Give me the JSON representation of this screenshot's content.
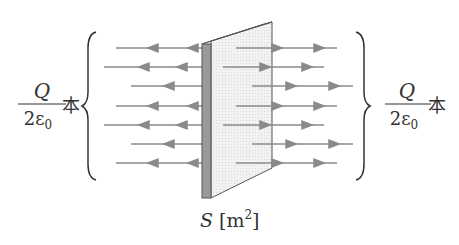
{
  "diagram": {
    "left_label": {
      "numerator": "Q",
      "denominator_base": "2ε",
      "denominator_sub": "0",
      "unit": "本"
    },
    "right_label": {
      "numerator": "Q",
      "denominator_base": "2ε",
      "denominator_sub": "0",
      "unit": "本"
    },
    "plate_label": {
      "symbol": "S",
      "unit_open": "[m",
      "unit_sup": "2",
      "unit_close": "]"
    },
    "colors": {
      "line": "#8a8a8a",
      "plate_face": "#ececec",
      "plate_edge": "#9a9a9a",
      "text": "#333333"
    }
  }
}
